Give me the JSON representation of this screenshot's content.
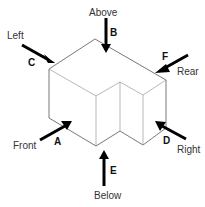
{
  "diagram": {
    "type": "orthographic-view-directions",
    "views": [
      {
        "letter": "A",
        "label": "Front"
      },
      {
        "letter": "B",
        "label": "Above"
      },
      {
        "letter": "C",
        "label": "Left"
      },
      {
        "letter": "D",
        "label": "Right"
      },
      {
        "letter": "E",
        "label": "Below"
      },
      {
        "letter": "F",
        "label": "Rear"
      }
    ]
  },
  "colors": {
    "arrow": "#000000",
    "edge": "#555555",
    "label": "#333333",
    "background": "#ffffff"
  }
}
